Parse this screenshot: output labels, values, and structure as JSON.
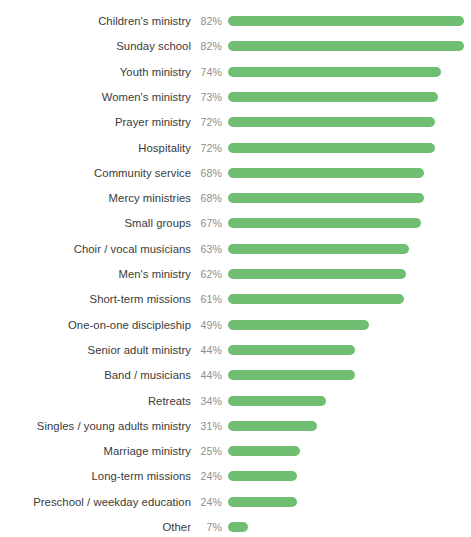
{
  "chart_data": {
    "type": "bar",
    "orientation": "horizontal",
    "title": "",
    "subtitle": "",
    "xlabel": "",
    "ylabel": "",
    "xlim": [
      0,
      82
    ],
    "grid": false,
    "legend": null,
    "value_suffix": "%",
    "bar_color": "#6fbe71",
    "label_color": "#3b3b3b",
    "value_color": "#8e8e8e",
    "background_color": "#ffffff",
    "categories": [
      "Children's ministry",
      "Sunday school",
      "Youth ministry",
      "Women's ministry",
      "Prayer ministry",
      "Hospitality",
      "Community service",
      "Mercy ministries",
      "Small groups",
      "Choir / vocal musicians",
      "Men's ministry",
      "Short-term missions",
      "One-on-one discipleship",
      "Senior adult ministry",
      "Band / musicians",
      "Retreats",
      "Singles / young adults ministry",
      "Marriage ministry",
      "Long-term missions",
      "Preschool / weekday education",
      "Other"
    ],
    "values": [
      82,
      82,
      74,
      73,
      72,
      72,
      68,
      68,
      67,
      63,
      62,
      61,
      49,
      44,
      44,
      34,
      31,
      25,
      24,
      24,
      7
    ],
    "value_labels": [
      "82%",
      "82%",
      "74%",
      "73%",
      "72%",
      "72%",
      "68%",
      "68%",
      "67%",
      "63%",
      "62%",
      "61%",
      "49%",
      "44%",
      "44%",
      "34%",
      "31%",
      "25%",
      "24%",
      "24%",
      "7%"
    ]
  }
}
